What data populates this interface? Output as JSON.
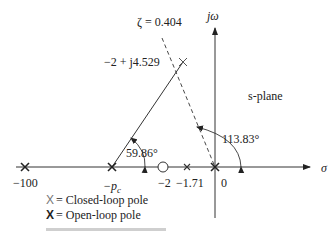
{
  "diagram": {
    "plane_label": "s-plane",
    "axes": {
      "real_axis_label": "σ",
      "imag_axis_label": "jω"
    },
    "damping_line": {
      "label": "ζ = 0.404"
    },
    "closed_loop_pole_label": "−2 + j4.529",
    "angles": {
      "angle_at_pc": "59.86°",
      "angle_at_origin": "113.83°"
    },
    "real_axis_points": [
      {
        "label": "−100",
        "type": "open-loop pole"
      },
      {
        "label": "−p",
        "subscript": "c",
        "type": "open-loop pole"
      },
      {
        "label": "−2",
        "type": "zero"
      },
      {
        "label": "−1.71",
        "type": "closed-loop pole"
      },
      {
        "label": "0",
        "type": "open-loop pole"
      }
    ],
    "legend": {
      "closed_loop": {
        "symbol": "X",
        "text": "= Closed-loop pole"
      },
      "open_loop": {
        "symbol": "X",
        "text": "= Open-loop pole"
      }
    },
    "colors": {
      "line": "#333333",
      "background": "#ffffff"
    }
  }
}
